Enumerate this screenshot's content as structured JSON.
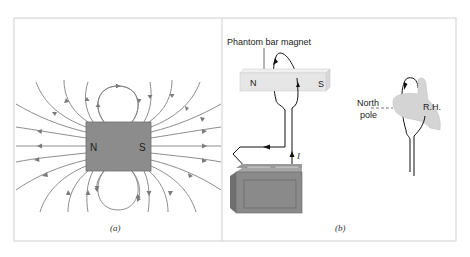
{
  "figure": {
    "panel_a": {
      "caption": "(a)",
      "magnet": {
        "north_label": "N",
        "south_label": "S",
        "fill": "#8c8c8c"
      },
      "field_line_color": "#7a7a7a"
    },
    "panel_b": {
      "caption": "(b)",
      "phantom_magnet_label": "Phantom bar magnet",
      "magnet": {
        "north_label": "N",
        "south_label": "S",
        "fill": "#e6e6e6"
      },
      "current_label": "I",
      "north_pole_label_line1": "North",
      "north_pole_label_line2": "pole",
      "right_hand_label": "R.H.",
      "battery_fill": "#808080"
    },
    "frame_color": "#cfcfcf"
  }
}
